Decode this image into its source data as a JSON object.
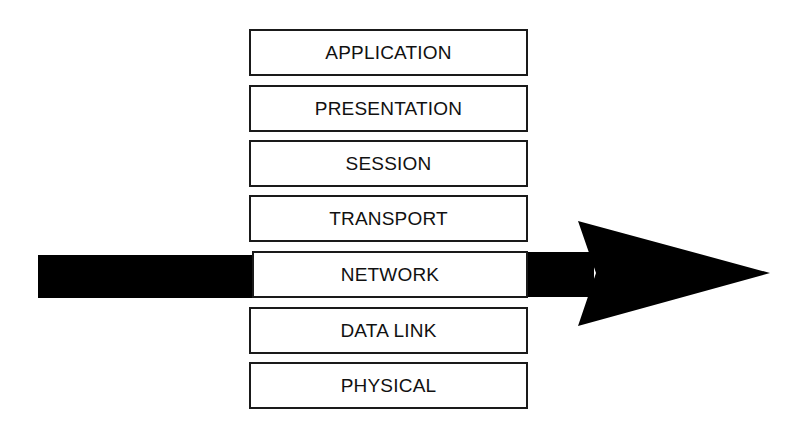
{
  "diagram": {
    "layers": [
      {
        "label": "APPLICATION"
      },
      {
        "label": "PRESENTATION"
      },
      {
        "label": "SESSION"
      },
      {
        "label": "TRANSPORT"
      },
      {
        "label": "NETWORK"
      },
      {
        "label": "DATA LINK"
      },
      {
        "label": "PHYSICAL"
      }
    ],
    "arrow": {
      "direction": "right",
      "passes_through_layer": "NETWORK",
      "color": "#000000"
    }
  }
}
